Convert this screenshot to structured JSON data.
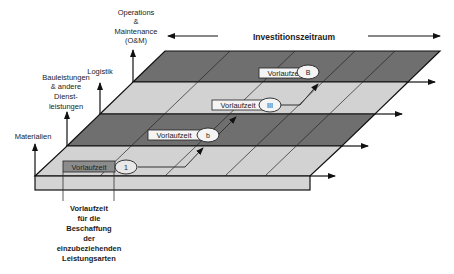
{
  "title": "Investitionszeitraum",
  "axis_labels": {
    "om": [
      "Operations",
      "&",
      "Maintenance",
      "(O&M)"
    ],
    "logistik": [
      "Logistik"
    ],
    "bau": [
      "Bauleistungen",
      "& andere",
      "Dienst-",
      "leistungen"
    ],
    "materialien": [
      "Materialien"
    ]
  },
  "bottom_caption": [
    "Vorlaufzeit",
    "für die",
    "Beschaffung",
    "der",
    "einzubeziehenden",
    "Leistungsarten"
  ],
  "layers": [
    {
      "name": "O&M",
      "color": "#6e6e6e"
    },
    {
      "name": "Logistik",
      "color": "#d0d0d0"
    },
    {
      "name": "Bauleistungen",
      "color": "#6e6e6e"
    },
    {
      "name": "Materialien",
      "color": "#d0d0d0"
    }
  ],
  "lead_times": [
    {
      "label": "Vorlaufzeit",
      "marker": "1",
      "layer": "Materialien"
    },
    {
      "label": "Vorlaufzeit",
      "marker": "b",
      "layer": "Bauleistungen"
    },
    {
      "label": "Vorlaufzeit",
      "marker": "III",
      "layer": "Logistik"
    },
    {
      "label": "Vorlaufzeit",
      "marker": "B",
      "layer": "O&M"
    }
  ],
  "colors": {
    "dark_band": "#6e6e6e",
    "light_band": "#d0d0d0",
    "front_face": "#d4d4d4",
    "line": "#1a1a1a"
  }
}
